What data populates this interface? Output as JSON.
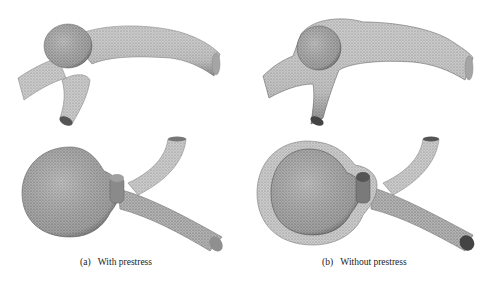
{
  "figure": {
    "panels": [
      {
        "id": "a",
        "tag": "(a)",
        "caption": "With prestress",
        "views": [
          "side-view-mesh",
          "top-view-mesh"
        ]
      },
      {
        "id": "b",
        "tag": "(b)",
        "caption": "Without prestress",
        "views": [
          "side-view-mesh-with-outer-wall",
          "top-view-mesh-with-outer-wall"
        ]
      }
    ]
  },
  "colors": {
    "background": "#ffffff",
    "mesh_fill": "#c9c9c9",
    "mesh_dark": "#6e6e6e",
    "outer_wall": "#b5b5b5",
    "caption_text": "#222222"
  }
}
